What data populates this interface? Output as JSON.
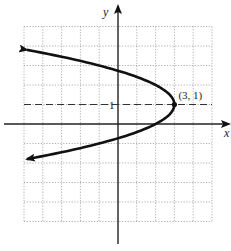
{
  "chart_data": {
    "type": "line",
    "title": "",
    "xlabel": "x",
    "ylabel": "y",
    "xlim": [
      -5,
      5
    ],
    "ylim": [
      -5,
      5
    ],
    "grid": true,
    "grid_style": "dotted",
    "equation": "x = -(y - 1)^2 + 3",
    "series": [
      {
        "name": "parabola",
        "orientation": "opens-left",
        "vertex": [
          3,
          1
        ],
        "arrows": "both-ends",
        "points": [
          [
            -4.84,
            3.8
          ],
          [
            -3.25,
            3.5
          ],
          [
            -1.0,
            3.0
          ],
          [
            0,
            2.73
          ],
          [
            1.0,
            2.41
          ],
          [
            2.0,
            2.0
          ],
          [
            2.75,
            1.5
          ],
          [
            3,
            1
          ],
          [
            2.75,
            0.5
          ],
          [
            2.0,
            0.0
          ],
          [
            1.0,
            -0.41
          ],
          [
            0,
            -0.73
          ],
          [
            -1.0,
            -1.0
          ],
          [
            -3.25,
            -1.5
          ],
          [
            -4.84,
            -1.8
          ]
        ]
      }
    ],
    "reference_lines": [
      {
        "type": "horizontal",
        "y": 1,
        "style": "dashed"
      }
    ],
    "annotations": [
      {
        "text": "(3, 1)",
        "at": [
          3,
          1
        ]
      },
      {
        "text": "1",
        "at": [
          0,
          1
        ],
        "role": "y-tick-label"
      }
    ]
  },
  "labels": {
    "x_axis": "x",
    "y_axis": "y",
    "vertex": "(3, 1)",
    "y_tick": "1"
  }
}
